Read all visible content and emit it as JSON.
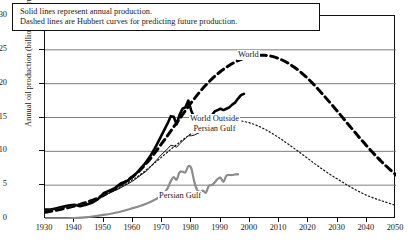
{
  "caption": {
    "line1": "Solid lines represent annual production.",
    "line2": "Dashed lines are Hubbert curves for predicting future production."
  },
  "labels": {
    "world": "World",
    "world_outside_pg_line1": "World Outside",
    "world_outside_pg_line2": "Persian Gulf",
    "persian_gulf": "Persian Gulf"
  },
  "chart_data": {
    "type": "line",
    "title": "",
    "xlabel": "",
    "ylabel": "Annual oil production (billions of barrels)",
    "xlim": [
      1930,
      2050
    ],
    "ylim": [
      0,
      30
    ],
    "xticks": [
      1930,
      1940,
      1950,
      1960,
      1970,
      1980,
      1990,
      2000,
      2010,
      2020,
      2030,
      2040,
      2050
    ],
    "yticks": [
      0,
      5,
      10,
      15,
      20,
      25,
      30
    ],
    "grid": "horizontal",
    "legend_position": "inline-annotations",
    "series": [
      {
        "name": "World",
        "style": "solid",
        "color": "#000000",
        "width": 2.6,
        "x": [
          1930,
          1932,
          1934,
          1936,
          1938,
          1940,
          1942,
          1944,
          1946,
          1948,
          1950,
          1952,
          1954,
          1956,
          1958,
          1960,
          1962,
          1964,
          1966,
          1968,
          1970,
          1972,
          1973,
          1974,
          1975,
          1976,
          1977,
          1978,
          1979,
          1980,
          1981,
          1982,
          1983,
          1984,
          1985,
          1986,
          1987,
          1988,
          1989,
          1990,
          1991,
          1992,
          1993,
          1994,
          1995,
          1996,
          1997,
          1998
        ],
        "y": [
          1.4,
          1.4,
          1.6,
          1.8,
          2.0,
          2.1,
          1.9,
          2.1,
          2.4,
          2.9,
          3.8,
          4.2,
          4.6,
          5.3,
          5.6,
          6.2,
          7.1,
          8.1,
          9.3,
          10.8,
          12.5,
          14.2,
          15.2,
          15.1,
          14.0,
          15.4,
          16.3,
          16.5,
          17.5,
          16.0,
          15.0,
          14.0,
          13.9,
          14.3,
          14.1,
          15.2,
          15.3,
          15.9,
          16.1,
          16.3,
          16.1,
          16.3,
          16.5,
          16.9,
          17.2,
          17.8,
          18.3,
          18.5
        ]
      },
      {
        "name": "World Hubbert curve",
        "style": "dashed",
        "color": "#000000",
        "width": 3.0,
        "x": [
          1930,
          1940,
          1950,
          1960,
          1965,
          1970,
          1975,
          1980,
          1985,
          1990,
          1995,
          2000,
          2005,
          2010,
          2015,
          2020,
          2025,
          2030,
          2035,
          2040,
          2045,
          2050
        ],
        "y": [
          1.0,
          1.9,
          3.5,
          6.3,
          8.4,
          11.2,
          14.2,
          17.2,
          19.8,
          21.8,
          23.2,
          24.0,
          24.2,
          23.7,
          22.5,
          20.7,
          18.4,
          15.9,
          13.3,
          10.8,
          8.5,
          6.5
        ]
      },
      {
        "name": "World Outside Persian Gulf",
        "style": "solid",
        "color": "#111111",
        "width": 1.0,
        "x": [
          1930,
          1935,
          1940,
          1945,
          1950,
          1955,
          1960,
          1965,
          1970,
          1972,
          1973,
          1974,
          1975,
          1976,
          1977,
          1978,
          1979,
          1980,
          1981,
          1982,
          1983,
          1984,
          1985,
          1986,
          1987,
          1988,
          1989,
          1990,
          1991,
          1992,
          1993,
          1994,
          1995,
          1996
        ],
        "y": [
          1.3,
          1.6,
          2.0,
          2.3,
          3.5,
          4.4,
          5.6,
          7.2,
          9.6,
          10.4,
          10.9,
          10.8,
          10.6,
          11.1,
          11.5,
          11.9,
          12.3,
          12.3,
          12.4,
          12.6,
          12.8,
          13.2,
          13.4,
          13.7,
          13.6,
          14.0,
          14.1,
          14.0,
          13.9,
          13.7,
          13.8,
          14.0,
          14.2,
          14.3
        ]
      },
      {
        "name": "World Outside Persian Gulf Hubbert curve",
        "style": "dotted",
        "color": "#111111",
        "width": 1.2,
        "x": [
          1930,
          1940,
          1950,
          1960,
          1965,
          1970,
          1975,
          1980,
          1985,
          1990,
          1995,
          2000,
          2005,
          2010,
          2015,
          2020,
          2025,
          2030,
          2035,
          2040,
          2045,
          2050
        ],
        "y": [
          1.2,
          2.0,
          3.4,
          5.8,
          7.4,
          9.2,
          11.0,
          12.6,
          13.8,
          14.5,
          14.6,
          14.2,
          13.3,
          12.0,
          10.5,
          8.9,
          7.3,
          5.9,
          4.6,
          3.5,
          2.7,
          2.0
        ]
      },
      {
        "name": "Persian Gulf",
        "style": "solid",
        "color": "#8c8c8c",
        "width": 2.2,
        "x": [
          1930,
          1940,
          1945,
          1950,
          1955,
          1960,
          1963,
          1966,
          1969,
          1970,
          1971,
          1972,
          1973,
          1974,
          1975,
          1976,
          1977,
          1978,
          1979,
          1980,
          1981,
          1982,
          1983,
          1984,
          1985,
          1986,
          1987,
          1988,
          1989,
          1990,
          1991,
          1992,
          1993,
          1994,
          1995,
          1996
        ],
        "y": [
          0.1,
          0.15,
          0.3,
          0.6,
          1.0,
          1.6,
          2.0,
          2.5,
          3.2,
          3.5,
          4.0,
          4.6,
          5.6,
          6.2,
          5.8,
          6.9,
          7.0,
          6.9,
          7.8,
          7.5,
          5.6,
          4.3,
          4.0,
          4.2,
          3.9,
          4.9,
          5.0,
          5.4,
          5.9,
          6.1,
          5.5,
          6.4,
          6.5,
          6.5,
          6.6,
          6.6
        ]
      }
    ]
  }
}
